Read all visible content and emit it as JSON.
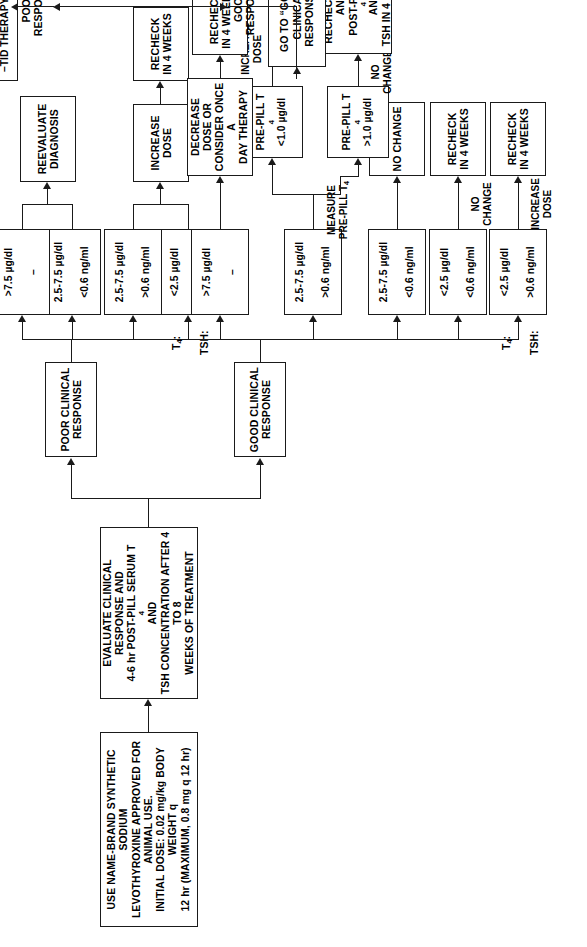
{
  "orientation": "rotated-90-ccw",
  "colors": {
    "ink": "#1a1a1a",
    "paper": "#ffffff"
  },
  "nodes": {
    "start": {
      "id": "start",
      "text": "USE NAME-BRAND SYNTHETIC SODIUM LEVOTHYROXINE APPROVED FOR ANIMAL USE. INITIAL DOSE: 0.02 mg/kg BODY WEIGHT q 12 hr (MAXIMUM, 0.8 mg q 12 hr)"
    },
    "evaluate": {
      "id": "evaluate",
      "text": "EVALUATE CLINICAL RESPONSE AND 4-6 hr POST-PILL SERUM T4 AND TSH CONCENTRATION AFTER 4 TO 8 WEEKS OF TREATMENT"
    },
    "poor_clinical_response": {
      "id": "poor-clinical-response",
      "text": "POOR CLINICAL RESPONSE"
    },
    "good_clinical_response": {
      "id": "good-clinical-response",
      "text": "GOOD CLINICAL RESPONSE"
    },
    "poor_v1": {
      "t4": "<2.5 µg/dl",
      "tsh": "–"
    },
    "poor_v2": {
      "t4": "2.5-7.5 µg/dl",
      "tsh": ">0.6 ng/ml"
    },
    "poor_v3": {
      "t4": "2.5-7.5 µg/dl",
      "tsh": "<0.6 ng/ml"
    },
    "poor_v4": {
      "t4": ">7.5 µg/dl",
      "tsh": "–"
    },
    "good_v1": {
      "t4": "<2.5 µg/dl",
      "tsh": ">0.6 ng/ml"
    },
    "good_v2": {
      "t4": "<2.5 µg/dl",
      "tsh": "<0.6 ng/ml"
    },
    "good_v3": {
      "t4": "2.5-7.5 µg/dl",
      "tsh": "<0.6 ng/ml"
    },
    "good_v4": {
      "t4": "2.5-7.5 µg/dl",
      "tsh": ">0.6 ng/ml"
    },
    "good_v5": {
      "t4": ">7.5 µg/dl",
      "tsh": "–"
    },
    "increase_dose_poor": {
      "id": "increase-dose",
      "text": "INCREASE\nDOSE"
    },
    "recheck_4wk_poor": {
      "id": "recheck-in-4-weeks",
      "text": "RECHECK\nIN 4 WEEKS"
    },
    "reevaluate_diagnosis": {
      "id": "reevaluate-diagnosis",
      "text": "REEVALUATE\nDIAGNOSIS"
    },
    "consider": {
      "id": "consider",
      "text": "CONSIDER:\n–INCREASING DOSE\n–CONCURRENT\n   DISEASE\n–TID THERAPY (?)"
    },
    "go_to_good": {
      "id": "go-to-good-clinical-response",
      "text": "GO TO “GOOD\nCLINICAL\nRESPONSE”"
    },
    "recheck_4wk_good_a": {
      "id": "recheck-in-4-weeks",
      "text": "RECHECK\nIN 4 WEEKS"
    },
    "recheck_4wk_good_b": {
      "id": "recheck-in-4-weeks",
      "text": "RECHECK\nIN 4 WEEKS"
    },
    "no_change_box": {
      "id": "no-change",
      "text": "NO CHANGE"
    },
    "decrease_dose": {
      "id": "decrease-dose-or-consider-once-a-day-therapy",
      "text": "DECREASE DOSE OR\nCONSIDER ONCE A\nDAY THERAPY"
    },
    "recheck_4wk_good_c": {
      "id": "recheck-in-4-weeks",
      "text": "RECHECK\nIN 4 WEEKS"
    },
    "prepill_lt": {
      "id": "pre-pill-t4-lt-1",
      "line1": "PRE-PILL T4",
      "line2": "<1.0 µg/dl"
    },
    "prepill_gt": {
      "id": "pre-pill-t4-gt-1",
      "line1": "PRE-PILL T4",
      "line2": ">1.0 µg/dl"
    },
    "recheck_pre_post": {
      "id": "recheck-pre-and-post-pill",
      "text": "RECHECK PRE- AND\nPOST-PILL T4 AND\nTSH IN 4 WEEKS"
    }
  },
  "labels": {
    "t4_row": "T4:",
    "tsh_row": "TSH:",
    "increase_dose_edge": "INCREASE DOSE",
    "no_change_edge": "NO CHANGE",
    "measure_prepill": "MEASURE\nPRE-PILL T4",
    "no_change_edge2": "NO CHANGE",
    "increase_dose_edge2": "INCREASE\nDOSE",
    "poor_response_edge": "POOR RESPONSE",
    "good_response_edge": "GOOD\nRESPONSE"
  }
}
